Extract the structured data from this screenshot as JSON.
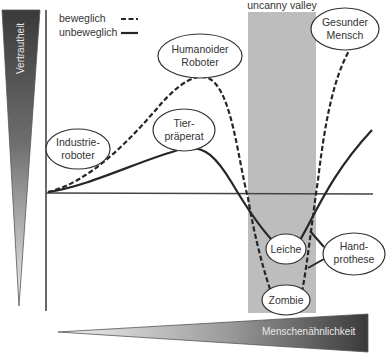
{
  "diagram": {
    "title": "uncanny valley",
    "y_axis_label": "Vertrautheit",
    "x_axis_label": "Menschenähnlichkeit",
    "legend": {
      "moving": {
        "label": "beweglich",
        "style": "dashed"
      },
      "still": {
        "label": "unbeweglich",
        "style": "solid"
      }
    },
    "nodes": [
      {
        "id": "industrieroboter",
        "line1": "Industrie-",
        "line2": "roboter"
      },
      {
        "id": "humanoider-roboter",
        "line1": "Humanoider",
        "line2": "Roboter"
      },
      {
        "id": "tierpraeparat",
        "line1": "Tier-",
        "line2": "präperat"
      },
      {
        "id": "gesunder-mensch",
        "line1": "Gesunder",
        "line2": "Mensch"
      },
      {
        "id": "leiche",
        "line1": "Leiche"
      },
      {
        "id": "handprothese",
        "line1": "Hand-",
        "line2": "prothese"
      },
      {
        "id": "zombie",
        "line1": "Zombie"
      }
    ],
    "colors": {
      "valley_band": "#bdbdbd",
      "curve": "#262626",
      "axis": "#444444",
      "gradient_dark": "#3a3a3a",
      "gradient_light": "#e6e6e6"
    }
  }
}
